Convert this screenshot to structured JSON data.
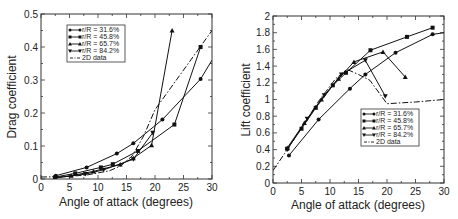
{
  "chart_data": [
    {
      "type": "line",
      "title": "",
      "xlabel": "Angle of attack (degrees)",
      "ylabel": "Drag coefficient",
      "xlim": [
        0,
        30
      ],
      "ylim": [
        0,
        0.5
      ],
      "xticks": [
        0,
        5,
        10,
        15,
        20,
        25,
        30
      ],
      "yticks": [
        0,
        0.1,
        0.2,
        0.3,
        0.4,
        0.5
      ],
      "ytick_labels": [
        "0",
        "0.1",
        "0.2",
        "0.3",
        "0.4",
        "0.5"
      ],
      "grid": false,
      "legend_position": "upper-left",
      "series": [
        {
          "name": "r/R = 31.6%",
          "marker": "circle",
          "x": [
            2.6,
            8.0,
            13.3,
            16.2,
            21.3,
            28.0,
            30.0
          ],
          "y": [
            0.01,
            0.035,
            0.077,
            0.108,
            0.18,
            0.303,
            0.36
          ]
        },
        {
          "name": "r/R = 45.8%",
          "marker": "square",
          "x": [
            2.5,
            6.0,
            10.5,
            12.6,
            17.0,
            23.4,
            28.0
          ],
          "y": [
            0.006,
            0.017,
            0.035,
            0.045,
            0.085,
            0.165,
            0.4
          ]
        },
        {
          "name": "r/R = 65.7%",
          "marker": "triangle-up",
          "x": [
            2.5,
            5.3,
            9.2,
            13.9,
            16.2,
            19.4,
            23.0
          ],
          "y": [
            0.004,
            0.01,
            0.023,
            0.044,
            0.063,
            0.102,
            0.45
          ]
        },
        {
          "name": "r/R = 84.2%",
          "marker": "triangle-down",
          "x": [
            2.4,
            7.8,
            11.0,
            16.2,
            19.6
          ],
          "y": [
            0.003,
            0.015,
            0.028,
            0.06,
            0.14
          ]
        },
        {
          "name": "2D data",
          "marker": "none",
          "dash": "dashdot",
          "x": [
            0,
            4,
            8,
            12,
            14,
            16,
            18,
            20,
            25,
            30
          ],
          "y": [
            0.006,
            0.007,
            0.012,
            0.025,
            0.04,
            0.07,
            0.13,
            0.21,
            0.33,
            0.45
          ]
        }
      ]
    },
    {
      "type": "line",
      "title": "",
      "xlabel": "Angle of attack (degrees)",
      "ylabel": "Lift coefficient",
      "xlim": [
        0,
        30
      ],
      "ylim": [
        0,
        2
      ],
      "xticks": [
        0,
        5,
        10,
        15,
        20,
        25,
        30
      ],
      "yticks": [
        0,
        0.2,
        0.4,
        0.6,
        0.8,
        1.0,
        1.2,
        1.4,
        1.6,
        1.8,
        2.0
      ],
      "ytick_labels": [
        "0",
        "0.2",
        "0.4",
        "0.6",
        "0.8",
        "1",
        "1.2",
        "1.4",
        "1.6",
        "1.8",
        "2"
      ],
      "grid": false,
      "legend_position": "lower-right",
      "series": [
        {
          "name": "r/R = 31.6%",
          "marker": "circle",
          "x": [
            2.8,
            8.0,
            13.5,
            16.2,
            21.5,
            28.0,
            30.0
          ],
          "y": [
            0.33,
            0.76,
            1.13,
            1.3,
            1.56,
            1.78,
            1.8
          ]
        },
        {
          "name": "r/R = 45.8%",
          "marker": "square",
          "x": [
            2.5,
            5.0,
            7.5,
            10.5,
            12.8,
            17.1,
            23.5,
            28.0
          ],
          "y": [
            0.41,
            0.65,
            0.9,
            1.17,
            1.32,
            1.59,
            1.75,
            1.86
          ]
        },
        {
          "name": "r/R = 65.7%",
          "marker": "triangle-up",
          "x": [
            2.5,
            5.5,
            8.5,
            11.5,
            14.2,
            19.3,
            23.2
          ],
          "y": [
            0.42,
            0.72,
            1.0,
            1.25,
            1.45,
            1.57,
            1.27
          ]
        },
        {
          "name": "r/R = 84.2%",
          "marker": "triangle-down",
          "x": [
            2.5,
            6.0,
            9.0,
            12.0,
            16.2,
            19.7
          ],
          "y": [
            0.4,
            0.77,
            1.05,
            1.3,
            1.47,
            1.04
          ]
        },
        {
          "name": "2D data",
          "marker": "none",
          "dash": "dashdot",
          "x": [
            0,
            2,
            5,
            8,
            11,
            13,
            15,
            17,
            20,
            25,
            30
          ],
          "y": [
            0.15,
            0.35,
            0.66,
            0.98,
            1.25,
            1.36,
            1.3,
            1.23,
            0.95,
            0.97,
            1.0
          ]
        }
      ]
    }
  ]
}
